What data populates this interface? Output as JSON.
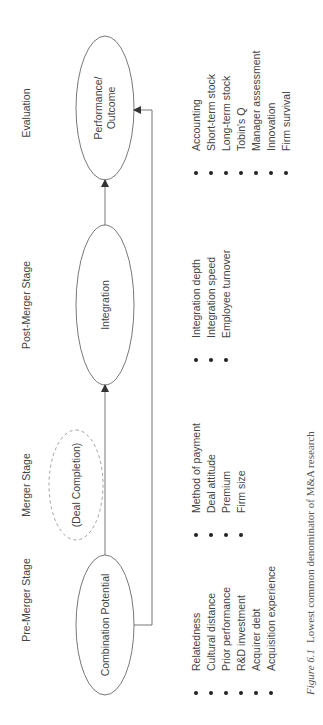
{
  "stages": [
    {
      "id": "pre-merger",
      "label": "Pre-Merger Stage"
    },
    {
      "id": "merger",
      "label": "Merger Stage"
    },
    {
      "id": "post-merger",
      "label": "Post-Merger Stage"
    },
    {
      "id": "evaluation",
      "label": "Evaluation"
    }
  ],
  "nodes": [
    {
      "id": "combination-potential",
      "label": "Combination Potential",
      "style": "solid"
    },
    {
      "id": "deal-completion",
      "label": "(Deal Completion)",
      "style": "dashed"
    },
    {
      "id": "integration",
      "label": "Integration",
      "style": "solid"
    },
    {
      "id": "performance",
      "label_line1": "Performance/",
      "label_line2": "Outcome",
      "style": "solid"
    }
  ],
  "edges": [
    {
      "from": "combination-potential",
      "to": "integration",
      "via": "deal-completion",
      "style": "straight-arrow"
    },
    {
      "from": "integration",
      "to": "performance",
      "style": "straight-arrow"
    },
    {
      "from": "combination-potential",
      "to": "performance",
      "style": "bracket-arrow"
    }
  ],
  "lists": {
    "pre_merger": [
      "Relatedness",
      "Cultural distance",
      "Prior performance",
      "R&D investment",
      "Acquirer debt",
      "Acquisition experience"
    ],
    "merger": [
      "Method of payment",
      "Deal attitude",
      "Premium",
      "Firm size"
    ],
    "post_merger": [
      "Integration depth",
      "Integration speed",
      "Employee turnover"
    ],
    "evaluation": [
      "Accounting",
      "Short-term stock",
      "Long-term stock",
      "Tobin's Q",
      "Manager assessment",
      "Innovation",
      "Firm survival"
    ]
  },
  "caption": {
    "figure_label": "Figure 6.1",
    "text": "Lowest common denominator of M&A research"
  },
  "colors": {
    "line": "#555555",
    "dashed": "#888888",
    "text": "#444444"
  }
}
